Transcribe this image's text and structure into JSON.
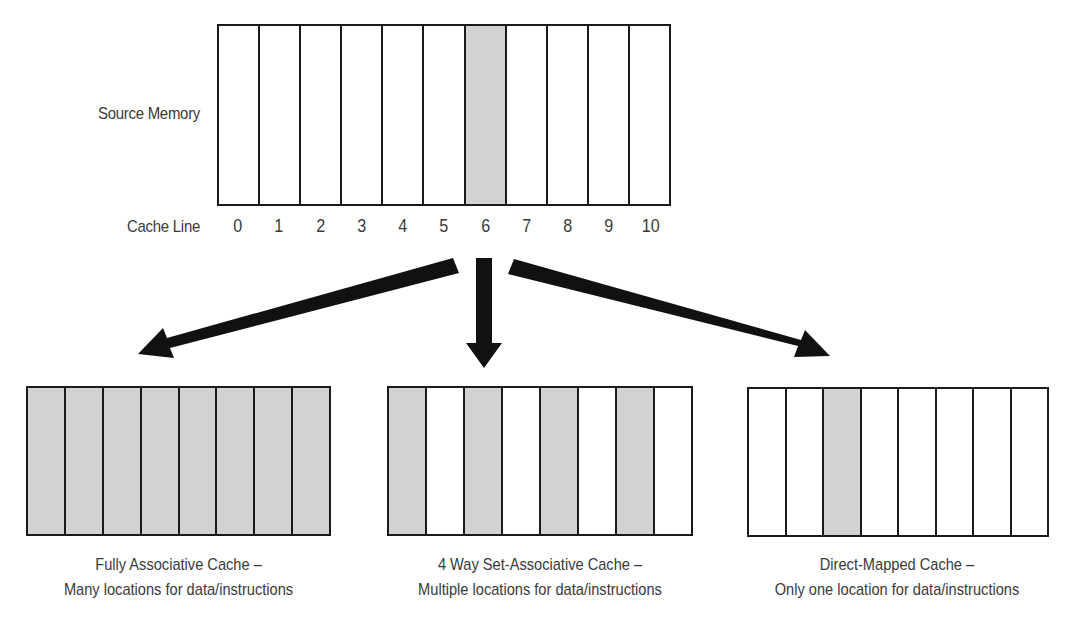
{
  "source": {
    "label": "Source Memory",
    "cache_line_label": "Cache Line",
    "lines": [
      "0",
      "1",
      "2",
      "3",
      "4",
      "5",
      "6",
      "7",
      "8",
      "9",
      "10"
    ],
    "shaded": [
      6
    ]
  },
  "caches": [
    {
      "id": "fully-associative",
      "title": "Fully Associative Cache –",
      "subtitle": "Many locations for data/instructions",
      "slots": 8,
      "shaded": [
        0,
        1,
        2,
        3,
        4,
        5,
        6,
        7
      ]
    },
    {
      "id": "set-associative",
      "title": "4 Way Set-Associative Cache –",
      "subtitle": "Multiple locations for data/instructions",
      "slots": 8,
      "shaded": [
        0,
        2,
        4,
        6
      ]
    },
    {
      "id": "direct-mapped",
      "title": "Direct-Mapped Cache –",
      "subtitle": "Only one location for data/instructions",
      "slots": 8,
      "shaded": [
        2
      ]
    }
  ],
  "colors": {
    "shade": "#d2d2d2",
    "line": "#1a1a1a",
    "text": "#3a3a3a"
  }
}
